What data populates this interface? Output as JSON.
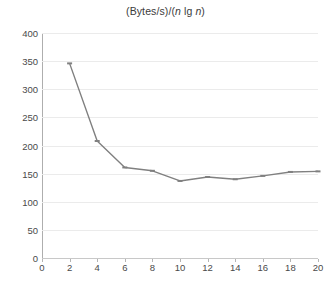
{
  "chart_data": {
    "type": "line",
    "title": "(Bytes/s)/(n lg n)",
    "title_parts": [
      {
        "text": "(Bytes/s)/(",
        "italic": false
      },
      {
        "text": "n",
        "italic": true
      },
      {
        "text": " lg ",
        "italic": false
      },
      {
        "text": "n",
        "italic": true
      },
      {
        "text": ")",
        "italic": false
      }
    ],
    "xlabel": "",
    "ylabel": "",
    "x": [
      2,
      4,
      6,
      8,
      10,
      12,
      14,
      16,
      18,
      20
    ],
    "values": [
      346,
      208,
      161,
      155,
      137,
      144,
      140,
      146,
      153,
      154
    ],
    "xlim": [
      0,
      20
    ],
    "ylim": [
      0,
      400
    ],
    "xticks": [
      0,
      2,
      4,
      6,
      8,
      10,
      12,
      14,
      16,
      18,
      20
    ],
    "yticks": [
      0,
      50,
      100,
      150,
      200,
      250,
      300,
      350,
      400
    ],
    "xtick_labels": [
      "0",
      "2",
      "4",
      "6",
      "8",
      "10",
      "12",
      "14",
      "16",
      "18",
      "20"
    ],
    "ytick_labels": [
      "0",
      "50",
      "100",
      "150",
      "200",
      "250",
      "300",
      "350",
      "400"
    ],
    "grid": true,
    "grid_axis": "y",
    "legend": null,
    "series_color": "#808080",
    "grid_color": "#ebebeb",
    "axis_color": "#aeaeae",
    "marker": "tick",
    "background": "#ffffff"
  }
}
